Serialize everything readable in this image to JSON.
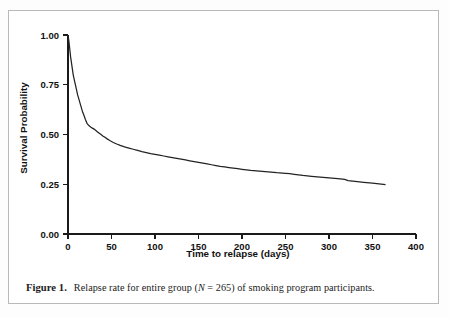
{
  "caption": {
    "label": "Figure 1.",
    "text_before_n": "Relapse rate for entire group (",
    "n_symbol": "N",
    "n_value": " = 265)",
    "text_after_n": " of smoking program participants."
  },
  "chart_data": {
    "type": "line",
    "title": "",
    "xlabel": "Time to relapse (days)",
    "ylabel": "Survival Probability",
    "xlim": [
      0,
      400
    ],
    "ylim": [
      0.0,
      1.0
    ],
    "xticks": [
      0,
      50,
      100,
      150,
      200,
      250,
      300,
      350,
      400
    ],
    "xtick_labels": [
      "0",
      "50",
      "100",
      "150",
      "200",
      "250",
      "300",
      "350",
      "400"
    ],
    "yticks": [
      0.0,
      0.25,
      0.5,
      0.75,
      1.0
    ],
    "ytick_labels": [
      "0.00",
      "0.25",
      "0.50",
      "0.75",
      "1.00"
    ],
    "grid": false,
    "legend": false,
    "line_color": "#232323",
    "series": [
      {
        "name": "Survival Probability",
        "x": [
          0,
          1,
          2,
          3,
          4,
          5,
          6,
          7,
          8,
          9,
          10,
          11,
          12,
          13,
          14,
          15,
          16,
          17,
          18,
          20,
          22,
          24,
          26,
          28,
          30,
          32,
          34,
          36,
          38,
          40,
          42,
          45,
          48,
          52,
          56,
          60,
          65,
          70,
          75,
          80,
          85,
          90,
          95,
          100,
          105,
          110,
          115,
          120,
          125,
          130,
          135,
          140,
          145,
          150,
          155,
          160,
          165,
          170,
          175,
          180,
          185,
          190,
          195,
          200,
          210,
          220,
          230,
          240,
          250,
          255,
          260,
          265,
          270,
          280,
          290,
          300,
          310,
          318,
          322,
          330,
          340,
          350,
          360,
          365
        ],
        "y": [
          1.0,
          0.97,
          0.93,
          0.89,
          0.86,
          0.83,
          0.8,
          0.78,
          0.76,
          0.74,
          0.72,
          0.7,
          0.685,
          0.67,
          0.655,
          0.64,
          0.625,
          0.61,
          0.6,
          0.575,
          0.555,
          0.545,
          0.538,
          0.532,
          0.527,
          0.52,
          0.513,
          0.506,
          0.5,
          0.493,
          0.487,
          0.478,
          0.47,
          0.46,
          0.452,
          0.445,
          0.438,
          0.432,
          0.426,
          0.42,
          0.414,
          0.409,
          0.404,
          0.4,
          0.396,
          0.392,
          0.388,
          0.384,
          0.38,
          0.376,
          0.372,
          0.368,
          0.364,
          0.36,
          0.356,
          0.352,
          0.348,
          0.344,
          0.34,
          0.337,
          0.334,
          0.331,
          0.328,
          0.325,
          0.32,
          0.316,
          0.312,
          0.308,
          0.305,
          0.303,
          0.3,
          0.297,
          0.294,
          0.29,
          0.286,
          0.282,
          0.278,
          0.274,
          0.268,
          0.264,
          0.26,
          0.256,
          0.251,
          0.248
        ]
      }
    ]
  }
}
